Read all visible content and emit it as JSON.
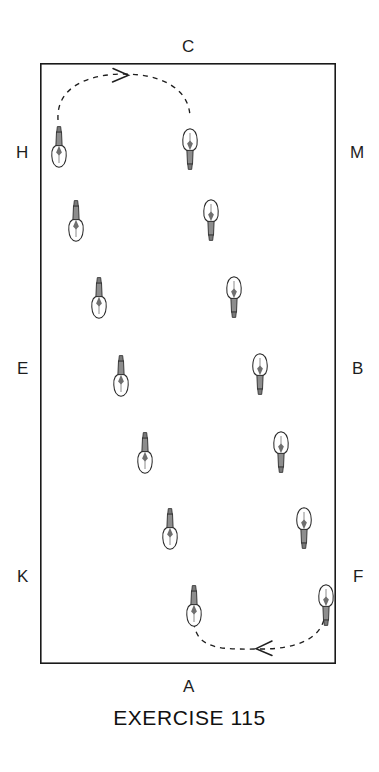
{
  "figure": {
    "type": "dressage-arena-diagram",
    "caption": "EXERCISE 115",
    "arena": {
      "x": 40,
      "y": 63,
      "width": 296,
      "height": 601,
      "stroke": "#1a1a1a",
      "stroke_width": 1.6,
      "fill": "#ffffff"
    },
    "markers": [
      {
        "label": "C",
        "side": "top",
        "x": 188,
        "y": 46
      },
      {
        "label": "H",
        "side": "left",
        "x": 22,
        "y": 153
      },
      {
        "label": "M",
        "side": "right",
        "x": 355,
        "y": 153
      },
      {
        "label": "E",
        "side": "left",
        "x": 22,
        "y": 369
      },
      {
        "label": "B",
        "side": "right",
        "x": 355,
        "y": 369
      },
      {
        "label": "K",
        "side": "left",
        "x": 22,
        "y": 577
      },
      {
        "label": "F",
        "side": "right",
        "x": 355,
        "y": 577
      },
      {
        "label": "A",
        "side": "bottom",
        "x": 188,
        "y": 687
      }
    ],
    "horses": [
      {
        "id": 1,
        "x": 59,
        "y": 140,
        "facing": "up",
        "label": "horse-1"
      },
      {
        "id": 2,
        "x": 190,
        "y": 140,
        "facing": "down",
        "label": "horse-2"
      },
      {
        "id": 3,
        "x": 76,
        "y": 216,
        "facing": "up",
        "label": "horse-3"
      },
      {
        "id": 4,
        "x": 210,
        "y": 216,
        "facing": "down",
        "label": "horse-4"
      },
      {
        "id": 5,
        "x": 99,
        "y": 293,
        "facing": "up",
        "label": "horse-5"
      },
      {
        "id": 6,
        "x": 234,
        "y": 290,
        "facing": "down",
        "label": "horse-6"
      },
      {
        "id": 7,
        "x": 121,
        "y": 371,
        "facing": "up",
        "label": "horse-7"
      },
      {
        "id": 8,
        "x": 260,
        "y": 368,
        "facing": "down",
        "label": "horse-8"
      },
      {
        "id": 9,
        "x": 145,
        "y": 448,
        "facing": "up",
        "label": "horse-9"
      },
      {
        "id": 10,
        "x": 280,
        "y": 446,
        "facing": "down",
        "label": "horse-10"
      },
      {
        "id": 11,
        "x": 170,
        "y": 524,
        "facing": "up",
        "label": "horse-11"
      },
      {
        "id": 12,
        "x": 303,
        "y": 522,
        "facing": "down",
        "label": "horse-12"
      },
      {
        "id": 13,
        "x": 193,
        "y": 601,
        "facing": "up",
        "label": "horse-13"
      },
      {
        "id": 14,
        "x": 325,
        "y": 599,
        "facing": "down",
        "label": "horse-14"
      }
    ],
    "arrows": [
      {
        "name": "top-turn-arrow",
        "direction": "right",
        "path": "M 59 120 C 59 84, 92 76, 125 76 C 158 76, 190 86, 190 118",
        "arrowhead": {
          "x": 127,
          "y": 77,
          "rotation": 2
        },
        "dash": "5,5"
      },
      {
        "name": "bottom-turn-arrow",
        "direction": "left",
        "path": "M 193 622 C 193 652, 226 650, 258 650 C 292 650, 325 640, 325 612",
        "arrowhead": {
          "x": 258,
          "y": 650,
          "rotation": 182
        },
        "dash": "5,5"
      }
    ]
  }
}
